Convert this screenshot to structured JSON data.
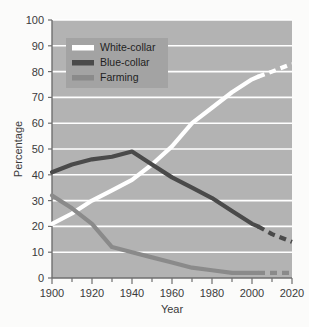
{
  "chart_data": {
    "type": "line",
    "title": "",
    "xlabel": "Year",
    "ylabel": "Percentage",
    "xlim": [
      1900,
      2020
    ],
    "ylim": [
      0,
      100
    ],
    "xticks": [
      1900,
      1920,
      1940,
      1960,
      1980,
      2000,
      2020
    ],
    "yticks": [
      0,
      10,
      20,
      30,
      40,
      50,
      60,
      70,
      80,
      90,
      100
    ],
    "grid": "horizontal-white-gridlines",
    "legend_position": "top-left-inside",
    "projection_note": "dashed segments after 2003 indicate projected values",
    "x": [
      1900,
      1910,
      1920,
      1930,
      1940,
      1950,
      1960,
      1970,
      1980,
      1990,
      2000,
      2003,
      2010,
      2020
    ],
    "series": [
      {
        "name": "White-collar",
        "color": "#ffffff",
        "solid_until": 2003,
        "values": [
          21,
          25,
          30,
          34,
          38,
          44,
          51,
          60,
          66,
          72,
          77,
          78,
          80,
          83
        ]
      },
      {
        "name": "Blue-collar",
        "color": "#4a4a4a",
        "solid_until": 2003,
        "values": [
          41,
          44,
          46,
          47,
          49,
          44,
          39,
          35,
          31,
          26,
          21,
          20,
          17,
          14
        ]
      },
      {
        "name": "Farming",
        "color": "#8a8a8a",
        "solid_until": 2003,
        "values": [
          32,
          27,
          21,
          12,
          10,
          8,
          6,
          4,
          3,
          2,
          2,
          2,
          2,
          2
        ]
      }
    ]
  },
  "axes": {
    "y_title": "Percentage",
    "x_title": "Year",
    "y_tick_labels": [
      "0",
      "10",
      "20",
      "30",
      "40",
      "50",
      "60",
      "70",
      "80",
      "90",
      "100"
    ],
    "x_tick_labels": [
      "1900",
      "1920",
      "1940",
      "1960",
      "1980",
      "2000",
      "2020"
    ]
  },
  "legend": {
    "items": [
      {
        "label": "White-collar",
        "swatch": "#ffffff"
      },
      {
        "label": "Blue-collar",
        "swatch": "#4a4a4a"
      },
      {
        "label": "Farming",
        "swatch": "#8a8a8a"
      }
    ]
  },
  "colors": {
    "page_background": "#fbfbfa",
    "plot_background": "#b3b3b3",
    "gridline": "#ffffff",
    "axis": "#6f6f6f",
    "legend_box": "#a3a3a3",
    "white_collar": "#ffffff",
    "blue_collar": "#4a4a4a",
    "farming": "#8a8a8a"
  }
}
